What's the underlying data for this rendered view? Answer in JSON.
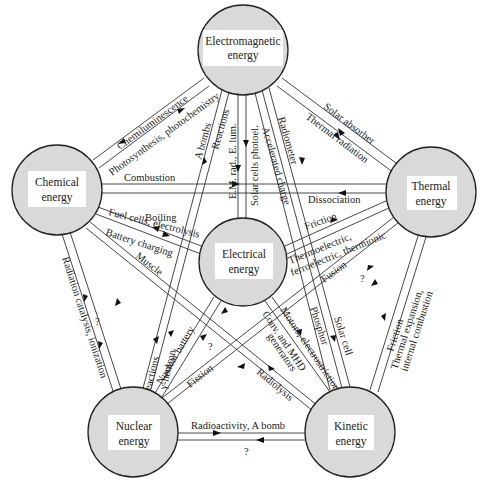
{
  "nodes": {
    "electromagnetic": {
      "line1": "Electromagnetic",
      "line2": "energy"
    },
    "chemical": {
      "line1": "Chemical",
      "line2": "energy"
    },
    "electrical": {
      "line1": "Electrical",
      "line2": "energy"
    },
    "thermal": {
      "line1": "Thermal",
      "line2": "energy"
    },
    "nuclear": {
      "line1": "Nuclear",
      "line2": "energy"
    },
    "kinetic": {
      "line1": "Kinetic",
      "line2": "energy"
    }
  },
  "edges": {
    "chem_em_1": "Chemiluminescence",
    "chem_em_2": "Photosynthesis, photochemistry",
    "em_thermal_1": "Solar absorber",
    "em_thermal_2": "Thermal radiation",
    "chem_thermal_1": "Combustion",
    "chem_thermal_2": "Dissociation",
    "chem_elec_boiling": "Boiling",
    "chem_elec_1": "Fuel cells, electrolysis",
    "chem_elec_2": "Battery charging",
    "chem_kin": "Muscle",
    "em_nuc_1": "A bombs",
    "em_nuc_2": "Reactions",
    "em_elec_1": "E.M. rad., E. lum.",
    "em_elec_2": "Solar cells photoel.",
    "em_kin_1": "Accelerated charge",
    "em_kin_2": "Radiometer",
    "thermal_elec_1": "Friction",
    "thermal_elec_2a": "Thermoelectric,",
    "thermal_elec_2b": "ferroelectric, thermionic",
    "thermal_nuc_1": "Fusion",
    "thermal_nuc_2": "?",
    "thermal_kin_1": "Friction",
    "thermal_kin_2a": "Thermal expansion,",
    "thermal_kin_2b": "internal combustion",
    "chem_nuc_1": "Radiation catalysis, ionization",
    "chem_nuc_2": "?",
    "nuc_em_1": "γ-reactions",
    "nuc_em_2": "γ-neutron",
    "nuc_elec_1": "Nuclear battery",
    "nuc_elec_2": "?",
    "nuc_thermal_1": "Fission",
    "elec_kin_1": "Motors, electrostriction",
    "elec_kin_2a": "Conv. and MHD",
    "elec_kin_2b": "generators",
    "kin_nuc": "Radiolysis",
    "em_kin_phosphor": "Phosphor",
    "em_kin_solar": "Solar cell",
    "nuc_kin_1": "Radioactivity,  A bomb",
    "nuc_kin_2": "?"
  },
  "colors": {
    "node_fill": "#d9d9d9",
    "stroke": "#222222",
    "background": "#ffffff"
  }
}
